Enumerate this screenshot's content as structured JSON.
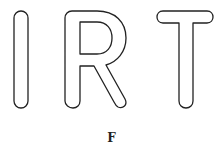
{
  "figure": {
    "letters": [
      "I",
      "R",
      "T"
    ],
    "style": "outlined rounded letters",
    "stroke_color": "#222222",
    "fill_color": "#ffffff"
  },
  "caption": "F"
}
